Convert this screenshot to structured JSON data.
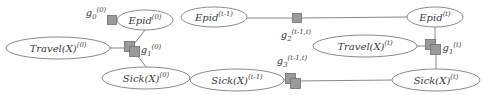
{
  "figure": {
    "type": "factor-graph-diagram",
    "title": "",
    "colors": {
      "background": "#ffffff",
      "edge": "#888888",
      "ellipse_stroke": "#8a8a8a",
      "ellipse_fill": "#ffffff",
      "factor_fill": "#9a9a9a",
      "factor_stroke": "#6e6e6e",
      "text": "#3a3a3a"
    }
  },
  "groups": {
    "initial_slice": {
      "name": "time-slice-0",
      "variables": [
        {
          "id": "epid-0",
          "base": "Epid",
          "superscript": "(0)",
          "text": "Epid(0)",
          "cx": 145,
          "cy": 20,
          "rx": 28,
          "ry": 10
        },
        {
          "id": "travel-x-0",
          "base": "Travel(X)",
          "superscript": "(0)",
          "text": "Travel(X)(0)",
          "cx": 58,
          "cy": 48,
          "rx": 52,
          "ry": 11
        },
        {
          "id": "sick-x-0",
          "base": "Sick(X)",
          "superscript": "(0)",
          "text": "Sick(X)(0)",
          "cx": 146,
          "cy": 78,
          "rx": 44,
          "ry": 11
        }
      ],
      "factors": [
        {
          "id": "g0-0",
          "base": "g",
          "subscript": "0",
          "superscript": "(0)",
          "text": "g0(0)",
          "x": 112,
          "y": 20,
          "size": 9,
          "stacked": false,
          "label_x": 96,
          "label_y": 14
        },
        {
          "id": "g1-0",
          "base": "g",
          "subscript": "1",
          "superscript": "(0)",
          "text": "g1(0)",
          "x": 130,
          "y": 48,
          "size": 10,
          "stacked": true,
          "label_x": 151,
          "label_y": 51
        }
      ]
    },
    "transition_slice": {
      "name": "time-slice-t",
      "variables": [
        {
          "id": "epid-t-1",
          "base": "Epid",
          "superscript": "(t-1)",
          "text": "Epid(t-1)",
          "cx": 214,
          "cy": 17,
          "rx": 33,
          "ry": 10
        },
        {
          "id": "epid-t",
          "base": "Epid",
          "superscript": "(t)",
          "text": "Epid(t)",
          "cx": 435,
          "cy": 17,
          "rx": 28,
          "ry": 10
        },
        {
          "id": "travel-x-t",
          "base": "Travel(X)",
          "superscript": "(t)",
          "text": "Travel(X)(t)",
          "cx": 365,
          "cy": 46,
          "rx": 52,
          "ry": 11
        },
        {
          "id": "sick-x-t-1",
          "base": "Sick(X)",
          "superscript": "(t-1)",
          "text": "Sick(X)(t-1)",
          "cx": 237,
          "cy": 80,
          "rx": 47,
          "ry": 11
        },
        {
          "id": "sick-x-t",
          "base": "Sick(X)",
          "superscript": "(t)",
          "text": "Sick(X)(t)",
          "cx": 436,
          "cy": 80,
          "rx": 44,
          "ry": 11
        }
      ],
      "factors": [
        {
          "id": "g2-t",
          "base": "g",
          "subscript": "2",
          "superscript": "(t-1,t)",
          "text": "g2(t-1,t)",
          "x": 297,
          "y": 18,
          "size": 9,
          "stacked": false,
          "label_x": 296,
          "label_y": 36
        },
        {
          "id": "g1-t",
          "base": "g",
          "subscript": "1",
          "superscript": "(t)",
          "text": "g1(t)",
          "x": 431,
          "y": 46,
          "size": 10,
          "stacked": true,
          "label_x": 452,
          "label_y": 49
        },
        {
          "id": "g3-t",
          "base": "g",
          "subscript": "3",
          "superscript": "(t-1,t)",
          "text": "g3(t-1,t)",
          "x": 291,
          "y": 80,
          "size": 10,
          "stacked": true,
          "label_x": 292,
          "label_y": 62
        }
      ]
    }
  },
  "edges": [
    {
      "id": "e-g0-epid0",
      "from": "g0-0",
      "to": "epid-0"
    },
    {
      "id": "e-epid0-g1",
      "from": "epid-0",
      "to": "g1-0"
    },
    {
      "id": "e-travel0-g1",
      "from": "travel-x-0",
      "to": "g1-0"
    },
    {
      "id": "e-g1-sick0",
      "from": "g1-0",
      "to": "sick-x-0"
    },
    {
      "id": "e-epidt1-g2",
      "from": "epid-t-1",
      "to": "g2-t"
    },
    {
      "id": "e-g2-epidt",
      "from": "g2-t",
      "to": "epid-t"
    },
    {
      "id": "e-epidt-g1t",
      "from": "epid-t",
      "to": "g1-t"
    },
    {
      "id": "e-travelt-g1t",
      "from": "travel-x-t",
      "to": "g1-t"
    },
    {
      "id": "e-g1t-sickt",
      "from": "g1-t",
      "to": "sick-x-t"
    },
    {
      "id": "e-sickt1-g3",
      "from": "sick-x-t-1",
      "to": "g3-t"
    },
    {
      "id": "e-g3-sickt",
      "from": "g3-t",
      "to": "sick-x-t"
    }
  ]
}
